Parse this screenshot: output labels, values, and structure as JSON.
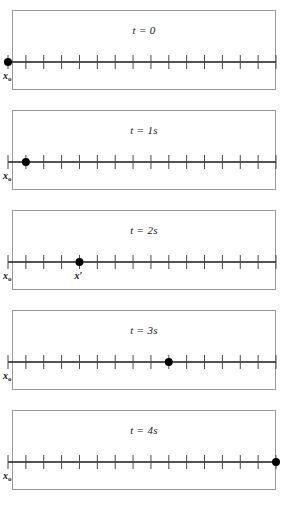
{
  "figure": {
    "background_color": "#ffffff",
    "line_color": "#1a1a1a",
    "border_color": "#9a9a9a",
    "marker_color": "#000000",
    "tick_count": 16,
    "axis_start_x": 8,
    "axis_end_x": 276,
    "tick_spacing": 17.2
  },
  "panels": [
    {
      "id": "panel-t0",
      "time_label_prefix": "t",
      "time_label_equals": " = ",
      "time_label_value": "0",
      "time_label_full": "t = 0",
      "marker_tick_index": 0,
      "labels": [
        {
          "name": "x-naught",
          "text": "x",
          "sub": "o",
          "prime": "",
          "tick_index": 0
        }
      ]
    },
    {
      "id": "panel-t1",
      "time_label_prefix": "t",
      "time_label_equals": " = ",
      "time_label_value": "1s",
      "time_label_full": "t = 1s",
      "marker_tick_index": 1,
      "labels": [
        {
          "name": "x-naught",
          "text": "x",
          "sub": "o",
          "prime": "",
          "tick_index": 0
        }
      ]
    },
    {
      "id": "panel-t2",
      "time_label_prefix": "t",
      "time_label_equals": " = ",
      "time_label_value": "2s",
      "time_label_full": "t = 2s",
      "marker_tick_index": 4,
      "labels": [
        {
          "name": "x-naught",
          "text": "x",
          "sub": "o",
          "prime": "",
          "tick_index": 0
        },
        {
          "name": "x-prime",
          "text": "x",
          "sub": "",
          "prime": "′",
          "tick_index": 4
        }
      ]
    },
    {
      "id": "panel-t3",
      "time_label_prefix": "t",
      "time_label_equals": " = ",
      "time_label_value": "3s",
      "time_label_full": "t = 3s",
      "marker_tick_index": 9,
      "labels": [
        {
          "name": "x-naught",
          "text": "x",
          "sub": "o",
          "prime": "",
          "tick_index": 0
        }
      ]
    },
    {
      "id": "panel-t4",
      "time_label_prefix": "t",
      "time_label_equals": " = ",
      "time_label_value": "4s",
      "time_label_full": "t = 4s",
      "marker_tick_index": 15,
      "labels": [
        {
          "name": "x-naught",
          "text": "x",
          "sub": "o",
          "prime": "",
          "tick_index": 0
        }
      ]
    }
  ],
  "chart_data": {
    "type": "scatter",
    "title": "",
    "xlabel": "",
    "ylabel": "",
    "categories": [
      "t = 0",
      "t = 1s",
      "t = 2s",
      "t = 3s",
      "t = 4s"
    ],
    "series": [
      {
        "name": "position (tick units)",
        "values": [
          0,
          1,
          4,
          9,
          15
        ]
      }
    ],
    "xlim": [
      0,
      15
    ],
    "grid": false,
    "legend": "none"
  }
}
